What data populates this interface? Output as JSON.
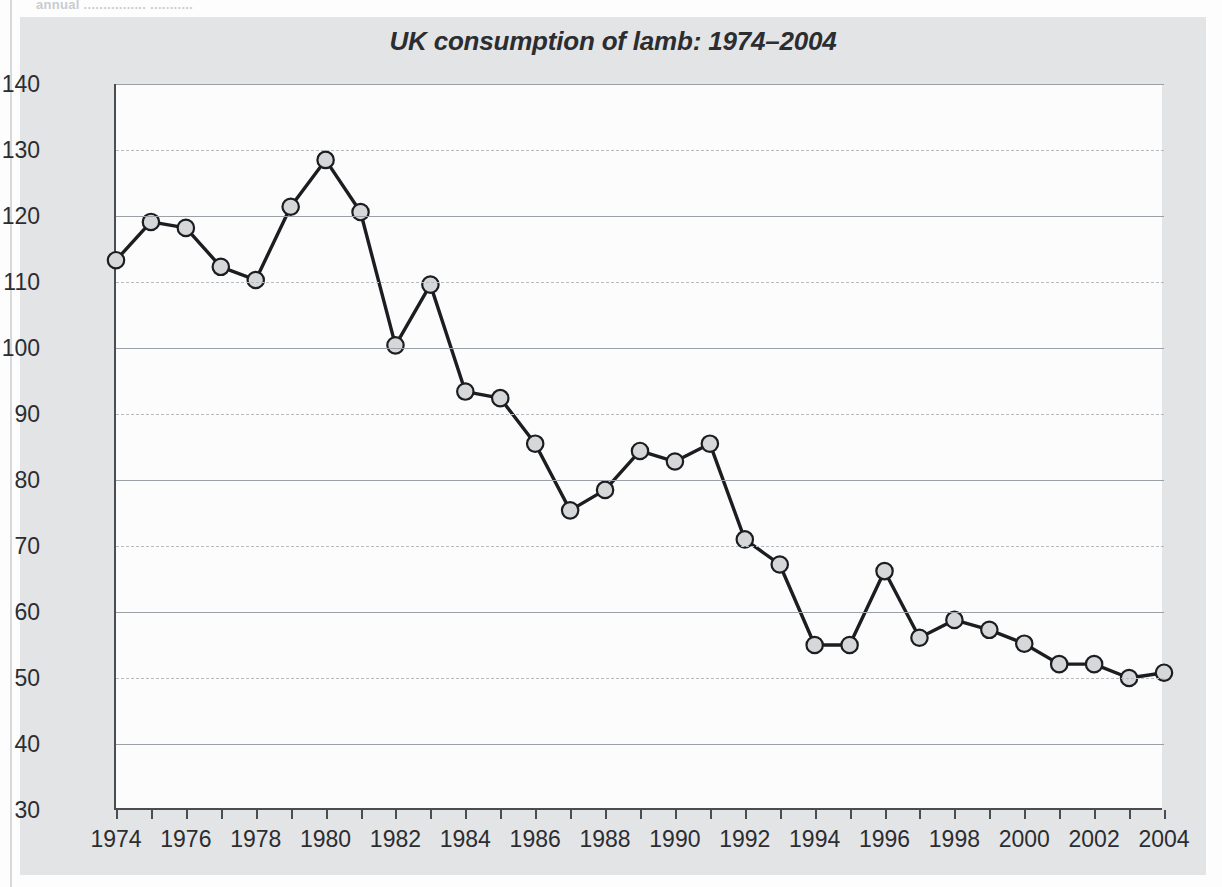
{
  "page": {
    "top_clipped_text": "annual ................ ..........."
  },
  "figure": {
    "title": "UK consumption of lamb: 1974–2004"
  },
  "chart_data": {
    "type": "line",
    "title": "UK consumption of lamb: 1974–2004",
    "xlabel": "",
    "ylabel": "Grams per person per week",
    "xlim": [
      1974,
      2004
    ],
    "ylim": [
      30,
      140
    ],
    "grid": true,
    "legend": false,
    "x": [
      1974,
      1975,
      1976,
      1977,
      1978,
      1979,
      1980,
      1981,
      1982,
      1983,
      1984,
      1985,
      1986,
      1987,
      1988,
      1989,
      1990,
      1991,
      1992,
      1993,
      1994,
      1995,
      1996,
      1997,
      1998,
      1999,
      2000,
      2001,
      2002,
      2003,
      2004
    ],
    "values": [
      113.3,
      119.1,
      118.2,
      112.3,
      110.3,
      121.4,
      128.5,
      120.6,
      100.4,
      109.6,
      93.4,
      92.4,
      85.5,
      75.4,
      78.5,
      84.4,
      82.8,
      85.5,
      71.0,
      67.2,
      55.0,
      55.0,
      66.2,
      56.1,
      58.8,
      57.3,
      55.2,
      52.1,
      52.1,
      50.0,
      50.8
    ],
    "series": [
      {
        "name": "UK consumption of lamb",
        "marker": "circle",
        "marker_fill": "#d6d7d9",
        "line_color": "#1b1d20",
        "values": [
          113.3,
          119.1,
          118.2,
          112.3,
          110.3,
          121.4,
          128.5,
          120.6,
          100.4,
          109.6,
          93.4,
          92.4,
          85.5,
          75.4,
          78.5,
          84.4,
          82.8,
          85.5,
          71.0,
          67.2,
          55.0,
          55.0,
          66.2,
          56.1,
          58.8,
          57.3,
          55.2,
          52.1,
          52.1,
          50.0,
          50.8
        ]
      }
    ],
    "y_ticks": [
      30,
      40,
      50,
      60,
      70,
      80,
      90,
      100,
      110,
      120,
      130,
      140
    ],
    "x_ticks_major": [
      1974,
      1976,
      1978,
      1980,
      1982,
      1984,
      1986,
      1988,
      1990,
      1992,
      1994,
      1996,
      1998,
      2000,
      2002,
      2004
    ],
    "x_ticks_minor": [
      1975,
      1977,
      1979,
      1981,
      1983,
      1985,
      1987,
      1989,
      1991,
      1993,
      1995,
      1997,
      1999,
      2001,
      2003
    ]
  },
  "colors": {
    "panel_background": "#e3e4e6",
    "plot_background": "#fcfcfc",
    "axis": "#4a4d52",
    "gridline_solid": "#9aa0a6",
    "gridline_dashed": "#b6bbc0",
    "line": "#1b1d20",
    "marker_fill": "#d6d7d9",
    "text": "#2b2d30"
  }
}
